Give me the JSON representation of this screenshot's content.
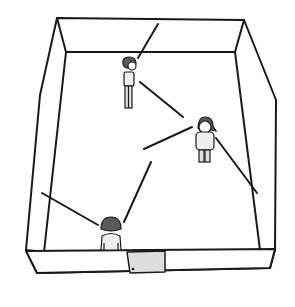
{
  "scene": {
    "description": "Top-down illustration of a room with three people and a door",
    "colors": {
      "line": "#1a1a1a",
      "background": "#ffffff",
      "door_fill": "#dcdcdc",
      "hair": "#5a5a5a",
      "clothes": "#eeeeee"
    },
    "people": [
      {
        "name": "person-top",
        "x": 130,
        "y": 75,
        "facing": "right"
      },
      {
        "name": "person-right",
        "x": 205,
        "y": 135,
        "facing": "front"
      },
      {
        "name": "person-bottom",
        "x": 112,
        "y": 230,
        "facing": "back"
      }
    ],
    "door": {
      "label": ""
    }
  }
}
